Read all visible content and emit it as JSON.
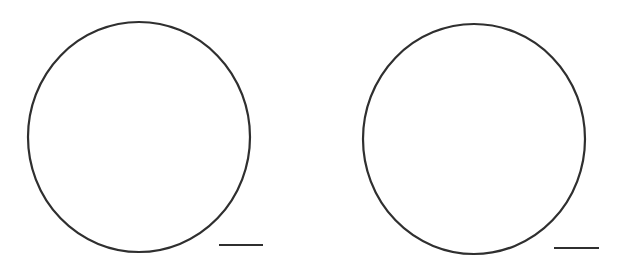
{
  "figure": {
    "background": "#ffffff",
    "stroke_color": "#2f2f2f",
    "shapes": [
      {
        "type": "circle",
        "cx": 139,
        "cy": 137,
        "rx": 111,
        "ry": 115,
        "stroke_width": 2.2
      },
      {
        "type": "circle",
        "cx": 474,
        "cy": 139,
        "rx": 111,
        "ry": 115,
        "stroke_width": 2.2
      }
    ],
    "scale_bars": [
      {
        "x1": 219,
        "y1": 245,
        "x2": 263,
        "y2": 245,
        "stroke_width": 1.8
      },
      {
        "x1": 554,
        "y1": 248,
        "x2": 599,
        "y2": 248,
        "stroke_width": 1.8
      }
    ]
  }
}
